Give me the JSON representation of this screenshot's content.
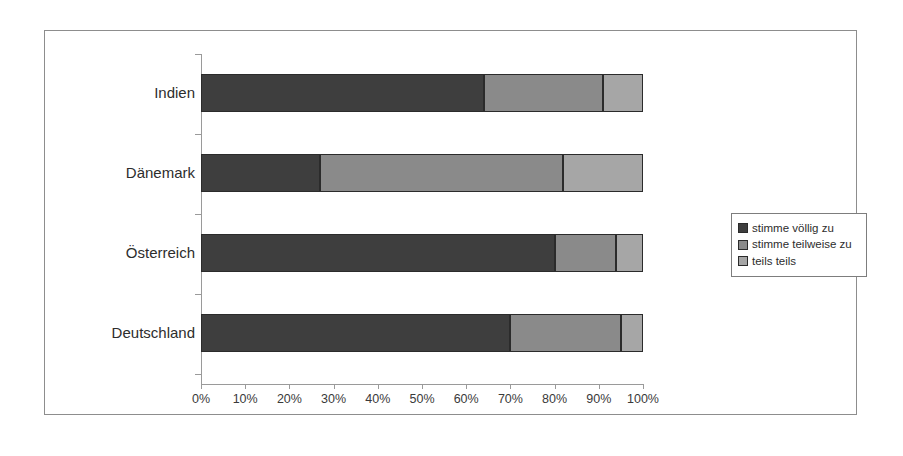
{
  "chart_data": {
    "type": "bar",
    "orientation": "horizontal",
    "stacked": true,
    "normalized": true,
    "title": "",
    "subtitle": "",
    "xlabel": "",
    "ylabel": "",
    "xlim": [
      0,
      100
    ],
    "xtick_labels": [
      "0%",
      "10%",
      "20%",
      "30%",
      "40%",
      "50%",
      "60%",
      "70%",
      "80%",
      "90%",
      "100%"
    ],
    "xtick_values": [
      0,
      10,
      20,
      30,
      40,
      50,
      60,
      70,
      80,
      90,
      100
    ],
    "grid": false,
    "legend_position": "right",
    "categories": [
      "Indien",
      "Dänemark",
      "Österreich",
      "Deutschland"
    ],
    "series": [
      {
        "name": "stimme völlig zu",
        "color": "#3e3e3e",
        "values": [
          64,
          27,
          80,
          70
        ]
      },
      {
        "name": "stimme teilweise zu",
        "color": "#8a8a8a",
        "values": [
          27,
          55,
          14,
          25
        ]
      },
      {
        "name": "teils teils",
        "color": "#a6a6a6",
        "values": [
          9,
          18,
          6,
          5
        ]
      }
    ],
    "cumulative_boundaries": {
      "Indien": [
        64,
        91,
        100
      ],
      "Dänemark": [
        27,
        82,
        100
      ],
      "Österreich": [
        80,
        94,
        100
      ],
      "Deutschland": [
        70,
        95,
        100
      ]
    }
  },
  "legend": {
    "items": [
      {
        "label": "stimme völlig zu",
        "color": "#3e3e3e"
      },
      {
        "label": "stimme teilweise zu",
        "color": "#8a8a8a"
      },
      {
        "label": "teils teils",
        "color": "#a6a6a6"
      }
    ]
  },
  "colors": {
    "frame": "#8d8d8d",
    "axis": "#9a9a9a",
    "bar_outline": "#2b2b2b",
    "text": "#2d2d2d",
    "background": "#ffffff"
  }
}
